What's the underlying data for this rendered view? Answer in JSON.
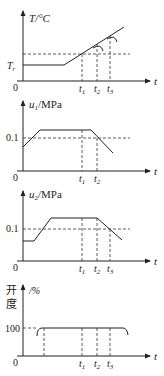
{
  "panels": [
    {
      "id": "temperature",
      "ylabel": "T/°C",
      "ytick": "T",
      "ytick_sub": "r",
      "xlabel": "t",
      "origin": "0",
      "ticks": [
        {
          "main": "t",
          "sub": "1"
        },
        {
          "main": "t",
          "sub": "2"
        },
        {
          "main": "t",
          "sub": "3"
        }
      ]
    },
    {
      "id": "pressure-u1",
      "ylabel_main": "u",
      "ylabel_sub": "1",
      "ylabel_unit": "/MPa",
      "ytick": "0.1",
      "xlabel": "t",
      "origin": "0",
      "ticks": [
        {
          "main": "t",
          "sub": "1"
        },
        {
          "main": "t",
          "sub": "2"
        }
      ]
    },
    {
      "id": "pressure-u2",
      "ylabel_main": "u",
      "ylabel_sub": "2",
      "ylabel_unit": "/MPa",
      "ytick": "0.1",
      "xlabel": "t",
      "origin": "0",
      "ticks": [
        {
          "main": "t",
          "sub": "1"
        },
        {
          "main": "t",
          "sub": "2"
        },
        {
          "main": "t",
          "sub": "3"
        }
      ]
    },
    {
      "id": "opening",
      "ylabel_line1": "开",
      "ylabel_line2": "度",
      "ylabel_unit": "/%",
      "ytick": "100",
      "xlabel": "t",
      "origin": "0",
      "ticks": [
        {
          "main": "t",
          "sub": "1"
        },
        {
          "main": "t",
          "sub": "2"
        },
        {
          "main": "t",
          "sub": "3"
        }
      ]
    }
  ]
}
